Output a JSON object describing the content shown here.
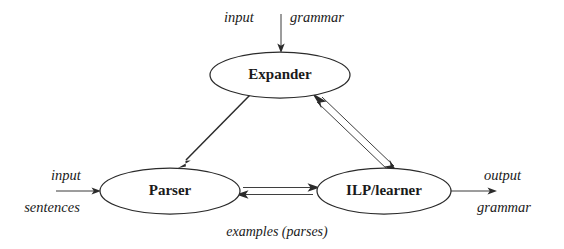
{
  "diagram": {
    "background_color": "#ffffff",
    "line_color": "#2b2b2b",
    "text_color": "#1a1a1a",
    "nodes": [
      {
        "id": "expander",
        "label": "Expander",
        "cx": 280,
        "cy": 75,
        "rx": 70,
        "ry": 23
      },
      {
        "id": "parser",
        "label": "Parser",
        "cx": 170,
        "cy": 191,
        "rx": 70,
        "ry": 23
      },
      {
        "id": "ilp",
        "label": "ILP/learner",
        "cx": 384,
        "cy": 191,
        "rx": 67,
        "ry": 23
      }
    ],
    "io_labels": {
      "top_left_word": "input",
      "top_right_word": "grammar",
      "left_line1": "input",
      "left_line2": "sentences",
      "right_line1": "output",
      "right_line2": "grammar"
    },
    "edge_labels": {
      "bottom_center": "examples (parses)"
    },
    "edges": [
      {
        "id": "input-grammar-to-expander",
        "from": "input grammar",
        "to": "expander",
        "style": "single",
        "direction": "down"
      },
      {
        "id": "input-sentences-to-parser",
        "from": "input sentences",
        "to": "parser",
        "style": "single",
        "direction": "right"
      },
      {
        "id": "ilp-to-output-grammar",
        "from": "ilp",
        "to": "output grammar",
        "style": "single",
        "direction": "right"
      },
      {
        "id": "expander-to-parser",
        "from": "expander",
        "to": "parser",
        "style": "single",
        "direction": "down-left"
      },
      {
        "id": "expander-ilp",
        "from": "expander",
        "to": "ilp",
        "style": "double-channel",
        "direction": "both"
      },
      {
        "id": "parser-ilp",
        "from": "parser",
        "to": "ilp",
        "style": "double-channel",
        "direction": "both"
      }
    ]
  }
}
